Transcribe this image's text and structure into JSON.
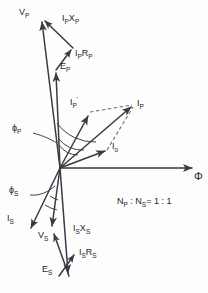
{
  "figure": {
    "background_color": "#fdfdfd",
    "line_color": "#3a3a42",
    "text_color": "#1f1f25"
  },
  "axis": {
    "flux_axis_label": "Φ",
    "origin": {
      "x": 60,
      "y": 168
    },
    "flux_axis_end": {
      "x": 196,
      "y": 168
    }
  },
  "annotation": {
    "turns_ratio_text": "Nₚ : Nₛ = 1 : 1",
    "turns_ratio_np": "N",
    "turns_ratio_np_sub": "P",
    "turns_ratio_ns": "N",
    "turns_ratio_ns_sub": "S",
    "turns_ratio_value": "= 1 : 1",
    "turns_ratio_sep": " : "
  },
  "angles": [
    {
      "name": "phi-p",
      "symbol": "ϕ",
      "subscript": "P",
      "label_x": 13,
      "label_y": 128,
      "leader": "M 34 133 L 50 139 L 57 143"
    },
    {
      "name": "phi-s",
      "symbol": "ϕ",
      "subscript": "S",
      "label_x": 10,
      "label_y": 190,
      "leader": "M 31 195 L 46 192 L 55 185"
    }
  ],
  "phasors": [
    {
      "name": "v-p",
      "label": "V",
      "sub": "P",
      "prime": "",
      "label_x": 22,
      "label_y": 12,
      "x1": 60,
      "y1": 168,
      "x2": 41,
      "y2": 18,
      "style": "solid"
    },
    {
      "name": "e-p",
      "label": "E",
      "sub": "P",
      "prime": "",
      "label_x": 60,
      "label_y": 66,
      "x1": 60,
      "y1": 168,
      "x2": 56,
      "y2": 70,
      "style": "solid"
    },
    {
      "name": "ip-rp",
      "label": "I",
      "sub": "P",
      "label2": "R",
      "sub2": "P",
      "prime": "",
      "label_x": 77,
      "label_y": 53,
      "x1": 56,
      "y1": 70,
      "x2": 73,
      "y2": 48,
      "style": "solid"
    },
    {
      "name": "ip-xp",
      "label": "I",
      "sub": "P",
      "label2": "X",
      "sub2": "P",
      "prime": "",
      "label_x": 65,
      "label_y": 18,
      "x1": 73,
      "y1": 48,
      "x2": 43,
      "y2": 19,
      "style": "solid"
    },
    {
      "name": "i-p",
      "label": "I",
      "sub": "P",
      "prime": "",
      "label_x": 137,
      "label_y": 102,
      "x1": 60,
      "y1": 168,
      "x2": 134,
      "y2": 105,
      "style": "solid"
    },
    {
      "name": "i-p-prime",
      "label": "I",
      "sub": "P",
      "prime": "′",
      "label_x": 71,
      "label_y": 100,
      "x1": 60,
      "y1": 168,
      "x2": 90,
      "y2": 113,
      "style": "solid"
    },
    {
      "name": "i-o",
      "label": "I",
      "sub": "o",
      "prime": "",
      "label_x": 113,
      "label_y": 145,
      "x1": 60,
      "y1": 168,
      "x2": 108,
      "y2": 150,
      "style": "solid"
    },
    {
      "name": "i-s",
      "label": "I",
      "sub": "S",
      "prime": "",
      "label_x": 9,
      "label_y": 218,
      "x1": 60,
      "y1": 168,
      "x2": 29,
      "y2": 231,
      "style": "solid"
    },
    {
      "name": "v-s",
      "label": "V",
      "sub": "S",
      "prime": "",
      "label_x": 39,
      "label_y": 234,
      "x1": 60,
      "y1": 168,
      "x2": 52,
      "y2": 229,
      "style": "solid"
    },
    {
      "name": "e-s",
      "label": "E",
      "sub": "S",
      "prime": "",
      "label_x": 44,
      "label_y": 268,
      "x1": 60,
      "y1": 168,
      "x2": 69,
      "y2": 276,
      "style": "solid"
    },
    {
      "name": "is-xs",
      "label": "I",
      "sub": "S",
      "label2": "X",
      "sub2": "S",
      "prime": "",
      "label_x": 73,
      "label_y": 228,
      "x1": 69,
      "y1": 276,
      "x2": 52,
      "y2": 231,
      "style": "solid"
    },
    {
      "name": "is-rs",
      "label": "I",
      "sub": "S",
      "label2": "R",
      "sub2": "S",
      "prime": "",
      "label_x": 78,
      "label_y": 252,
      "x1": 59,
      "y1": 276,
      "x2": 76,
      "y2": 253,
      "style": "solid"
    }
  ],
  "dashed_construction": [
    {
      "name": "ipprime-to-ip",
      "x1": 90,
      "y1": 112,
      "x2": 134,
      "y2": 105
    },
    {
      "name": "io-to-ip",
      "x1": 108,
      "y1": 150,
      "x2": 134,
      "y2": 105
    }
  ]
}
